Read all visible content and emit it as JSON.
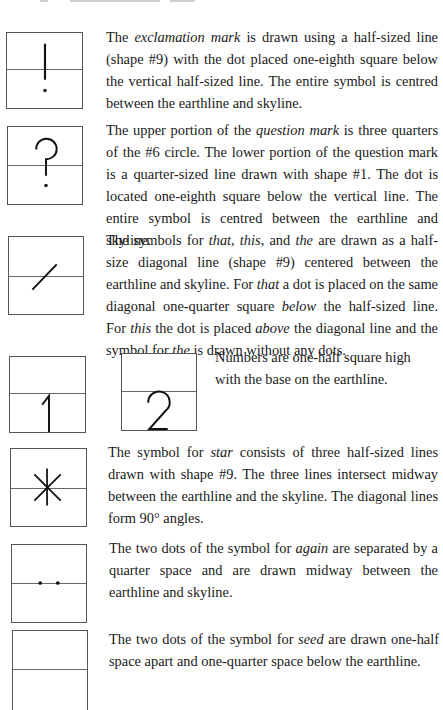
{
  "page": {
    "header_fragment": "clipped-running-head"
  },
  "entries": [
    {
      "symbol": "exclamation mark",
      "glyph_icon": "exclamation-glyph-icon",
      "segments": [
        {
          "t": "The "
        },
        {
          "t": "exclamation mark",
          "em": true
        },
        {
          "t": " is drawn using a half-sized line (shape #9) with the dot placed one-eighth square below the vertical half-sized line. The entire symbol is centred between the earthline and skyline."
        }
      ]
    },
    {
      "symbol": "question mark",
      "glyph_icon": "question-glyph-icon",
      "segments": [
        {
          "t": "The upper portion of the "
        },
        {
          "t": "question mark",
          "em": true
        },
        {
          "t": " is three quarters of the #6 circle. The lower portion of the question mark is a quarter-sized line drawn with shape #1. The dot is located one-eighth square below the vertical line. The entire symbol is centred between the earthline and skyline."
        }
      ]
    },
    {
      "symbol": "that / this / the",
      "glyph_icon": "diagonal-line-glyph-icon",
      "segments": [
        {
          "t": "The symbols for "
        },
        {
          "t": "that",
          "em": true
        },
        {
          "t": ", "
        },
        {
          "t": "this",
          "em": true
        },
        {
          "t": ", and "
        },
        {
          "t": "the",
          "em": true
        },
        {
          "t": " are drawn as a half-size diagonal line (shape #9) centered between the earthline and skyline. For "
        },
        {
          "t": "that",
          "em": true
        },
        {
          "t": " a dot is placed on the same diagonal one-quarter square "
        },
        {
          "t": "below",
          "em": true
        },
        {
          "t": " the half-sized line. For "
        },
        {
          "t": "this",
          "em": true
        },
        {
          "t": " the dot is placed "
        },
        {
          "t": "above",
          "em": true
        },
        {
          "t": " the diagonal line and the symbol for "
        },
        {
          "t": "the",
          "em": true
        },
        {
          "t": " is drawn without any dots."
        }
      ]
    },
    {
      "symbol": "numbers",
      "glyph_icon": "numbers-glyph-icon",
      "digits": [
        "1",
        "2"
      ],
      "segments": [
        {
          "t": "Numbers are one-half square high with the base on the earthline."
        }
      ]
    },
    {
      "symbol": "star",
      "glyph_icon": "star-glyph-icon",
      "segments": [
        {
          "t": "The symbol for "
        },
        {
          "t": "star",
          "em": true
        },
        {
          "t": " consists of three half-sized lines drawn with shape #9. The three lines intersect midway between the earthline and the skyline. The diagonal lines form 90° angles."
        }
      ]
    },
    {
      "symbol": "again",
      "glyph_icon": "two-dots-midline-glyph-icon",
      "segments": [
        {
          "t": "The two dots of the symbol for "
        },
        {
          "t": "again",
          "em": true
        },
        {
          "t": " are separated by a quarter space and are drawn midway between the earthline and skyline."
        }
      ]
    },
    {
      "symbol": "seed",
      "glyph_icon": "two-dots-below-glyph-icon",
      "segments": [
        {
          "t": "The two dots of the symbol for "
        },
        {
          "t": "seed",
          "em": true
        },
        {
          "t": " are drawn one-half space apart and one-quarter space below the earthline."
        }
      ]
    }
  ]
}
